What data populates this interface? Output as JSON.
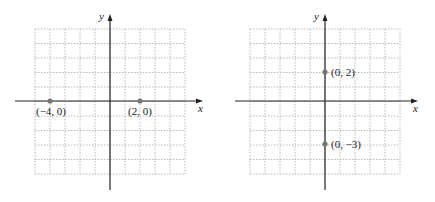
{
  "colors": {
    "grid": "#b8b8b8",
    "axis": "#222222",
    "point": "#777777",
    "text": "#222222"
  },
  "graphs": [
    {
      "name": "left-graph",
      "grid": {
        "x0": 35,
        "y0": 29,
        "cols": 10,
        "rows": 10,
        "cw": 15,
        "ch": 14.5
      },
      "origin": {
        "x": 110,
        "y": 101
      },
      "axes": {
        "x_from": 15,
        "x_to": 203,
        "y_from": 190,
        "y_to": 14
      },
      "x_label": "x",
      "y_label": "y",
      "points": [
        {
          "label": "(−4, 0)",
          "px": 50,
          "py": 101,
          "lx": 36,
          "ly": 115
        },
        {
          "label": "(2, 0)",
          "px": 140,
          "py": 101,
          "lx": 128,
          "ly": 115
        }
      ]
    },
    {
      "name": "right-graph",
      "grid": {
        "x0": 250,
        "y0": 29,
        "cols": 10,
        "rows": 10,
        "cw": 15,
        "ch": 14.5
      },
      "origin": {
        "x": 325,
        "y": 101
      },
      "axes": {
        "x_from": 235,
        "x_to": 418,
        "y_from": 190,
        "y_to": 14
      },
      "x_label": "x",
      "y_label": "y",
      "points": [
        {
          "label": "(0, 2)",
          "px": 325,
          "py": 72,
          "lx": 331,
          "ly": 76
        },
        {
          "label": "(0, −3)",
          "px": 325,
          "py": 144,
          "lx": 331,
          "ly": 148
        }
      ]
    }
  ]
}
